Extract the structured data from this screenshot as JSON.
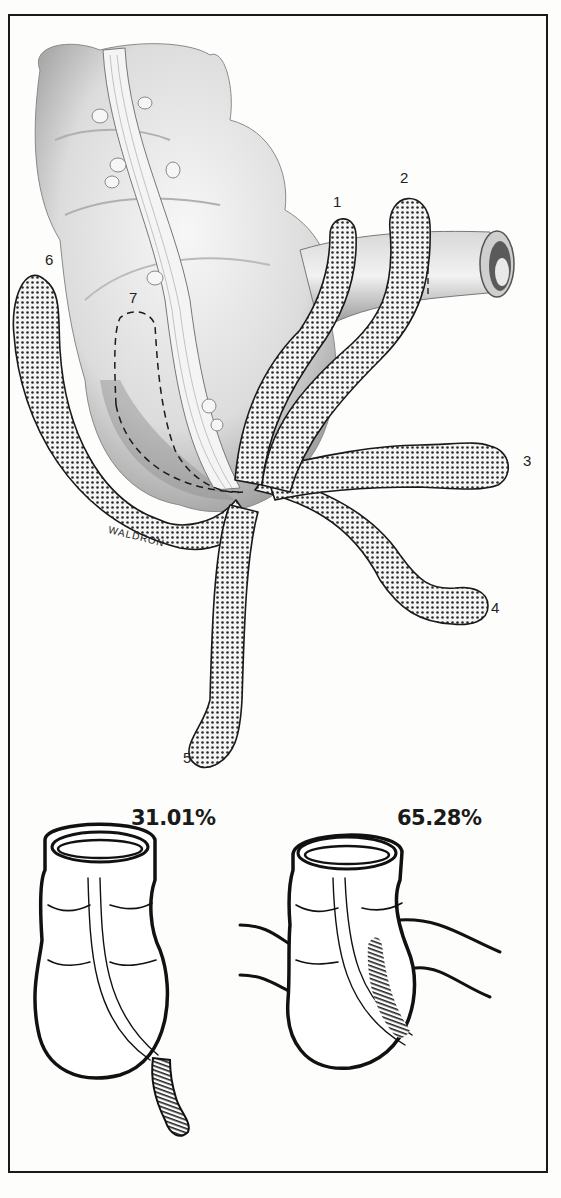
{
  "figure": {
    "artist_signature": "WALDRON",
    "position_labels": [
      "1",
      "2",
      "3",
      "4",
      "5",
      "6",
      "7"
    ],
    "comparison": [
      {
        "label": "31.01%",
        "variant": "appendix hanging below cecum"
      },
      {
        "label": "65.28%",
        "variant": "appendix retrocecal along cecum wall"
      }
    ]
  },
  "colors": {
    "border": "#1a1a1a",
    "stipple": "#2a2a2a",
    "tissue_light": "#ececec",
    "tissue_shadow": "#9a9a9a",
    "background": "#fdfdfc"
  }
}
